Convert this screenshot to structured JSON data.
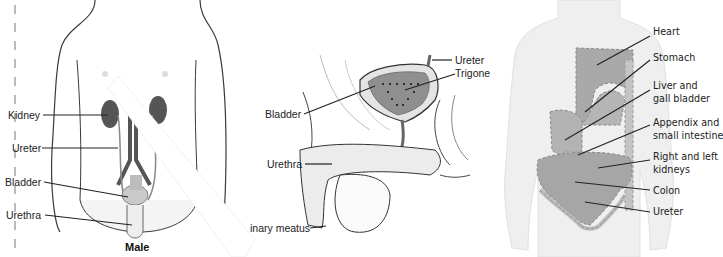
{
  "panels": [
    {
      "id": "male-urinary-front",
      "title": "Male",
      "labels": [
        "Kidney",
        "Ureter",
        "Bladder",
        "Urethra"
      ]
    },
    {
      "id": "male-urinary-sagittal",
      "labels": [
        "Ureter",
        "Trigone",
        "Bladder",
        "Urethra",
        "inary meatus"
      ]
    },
    {
      "id": "referred-pain-torso",
      "labels": [
        "Heart",
        "Stomach",
        "Liver and",
        "gall bladder",
        "Appendix and",
        "small intestine",
        "Right and left",
        "kidneys",
        "Colon",
        "Ureter"
      ]
    }
  ],
  "colors": {
    "outline": "#3a3a3a",
    "organ_dark": "#5a5a5a",
    "body_fill": "#f2f2f2",
    "zone_fill": "#a9a9a9",
    "band": "#ffffff"
  }
}
